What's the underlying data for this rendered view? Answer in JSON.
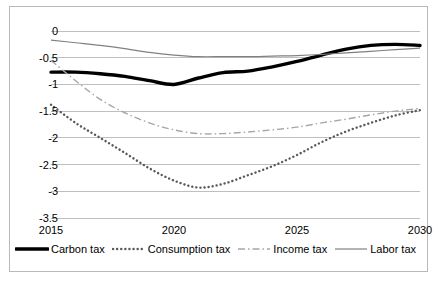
{
  "chart_data": {
    "type": "line",
    "title": "",
    "xlabel": "",
    "ylabel": "",
    "xlim": [
      2015,
      2030
    ],
    "ylim": [
      -3.5,
      0
    ],
    "grid": true,
    "legend_position": "bottom",
    "x_ticks": [
      "2015",
      "2020",
      "2025",
      "2030"
    ],
    "x_tick_values": [
      2015,
      2020,
      2025,
      2030
    ],
    "y_ticks": [
      "0",
      "-0.5",
      "-1",
      "-1.5",
      "-2",
      "-2.5",
      "-3",
      "-3.5"
    ],
    "y_tick_values": [
      0,
      -0.5,
      -1,
      -1.5,
      -2,
      -2.5,
      -3,
      -3.5
    ],
    "x": [
      2015,
      2016,
      2017,
      2018,
      2019,
      2020,
      2021,
      2022,
      2023,
      2024,
      2025,
      2026,
      2027,
      2028,
      2029,
      2030
    ],
    "series": [
      {
        "name": "Carbon tax",
        "style": "solid-thick",
        "color": "#000000",
        "values": [
          -0.77,
          -0.77,
          -0.8,
          -0.85,
          -0.93,
          -1.0,
          -0.88,
          -0.78,
          -0.75,
          -0.67,
          -0.57,
          -0.45,
          -0.34,
          -0.27,
          -0.25,
          -0.27
        ]
      },
      {
        "name": "Consumption tax",
        "style": "dotted",
        "color": "#595959",
        "values": [
          -1.38,
          -1.72,
          -2.0,
          -2.28,
          -2.57,
          -2.8,
          -2.93,
          -2.86,
          -2.7,
          -2.53,
          -2.32,
          -2.08,
          -1.88,
          -1.72,
          -1.58,
          -1.48
        ]
      },
      {
        "name": "Income tax",
        "style": "dash-dot",
        "color": "#a6a6a6",
        "values": [
          -0.55,
          -0.93,
          -1.28,
          -1.53,
          -1.72,
          -1.85,
          -1.92,
          -1.92,
          -1.89,
          -1.85,
          -1.8,
          -1.72,
          -1.65,
          -1.57,
          -1.5,
          -1.45
        ]
      },
      {
        "name": "Labor tax",
        "style": "solid-thin",
        "color": "#808080",
        "values": [
          -0.17,
          -0.22,
          -0.27,
          -0.33,
          -0.4,
          -0.45,
          -0.48,
          -0.48,
          -0.48,
          -0.47,
          -0.46,
          -0.44,
          -0.41,
          -0.38,
          -0.35,
          -0.32
        ]
      }
    ]
  },
  "legend": {
    "items": [
      {
        "label": "Carbon tax",
        "style": "solid-thick",
        "color": "#000000"
      },
      {
        "label": "Consumption tax",
        "style": "dotted",
        "color": "#595959"
      },
      {
        "label": "Income tax",
        "style": "dash-dot",
        "color": "#a6a6a6"
      },
      {
        "label": "Labor tax",
        "style": "solid-thin",
        "color": "#808080"
      }
    ]
  },
  "colors": {
    "grid": "#bfbfbf",
    "border": "#b9b9b9",
    "background": "#ffffff",
    "text": "#000000"
  }
}
